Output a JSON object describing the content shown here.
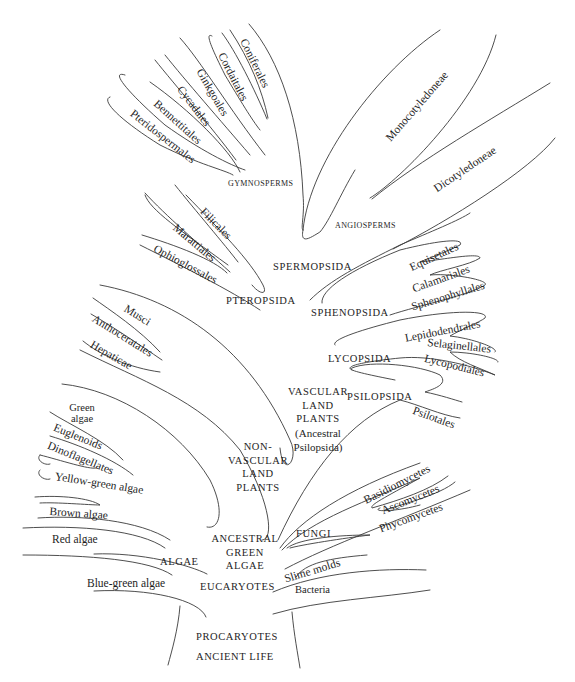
{
  "diagram": {
    "type": "phylogenetic-tree",
    "colors": {
      "background": "#ffffff",
      "line": "#3a3a3a",
      "text": "#1e1e1e"
    },
    "root": {
      "labels": [
        "PROCARYOTES",
        "ANCIENT LIFE"
      ]
    },
    "procaryotes": {
      "left_branch": "Blue-green algae",
      "right_branch": "Bacteria"
    },
    "eucaryotes": {
      "label": "EUCARYOTES",
      "slime_molds": "Slime molds"
    },
    "fungi": {
      "label": "FUNGI",
      "taxa": [
        "Basidiomycetes",
        "Ascomycetes",
        "Phycomycetes"
      ]
    },
    "algae": {
      "label": "ALGAE",
      "taxa": [
        "Green algae",
        "Euglenoids",
        "Dinoflagellates",
        "Yellow-green algae",
        "Brown algae",
        "Red algae"
      ],
      "green_algae_line1": "Green",
      "green_algae_line2": "algae"
    },
    "ancestral_green_algae": {
      "lines": [
        "ANCESTRAL",
        "GREEN",
        "ALGAE"
      ]
    },
    "non_vascular": {
      "lines": [
        "NON-",
        "VASCULAR",
        "LAND",
        "PLANTS"
      ],
      "taxa": [
        "Musci",
        "Anthoceratales",
        "Hepaticae"
      ]
    },
    "vascular": {
      "lines": [
        "VASCULAR",
        "LAND",
        "PLANTS",
        "(Ancestral",
        "Psilopsida)"
      ]
    },
    "psilopsida": {
      "label": "PSILOPSIDA",
      "taxa": [
        "Psilotales"
      ]
    },
    "lycopsida": {
      "label": "LYCOPSIDA",
      "taxa": [
        "Lepidodendrales",
        "Selaginellales",
        "Lycopodiales"
      ]
    },
    "sphenopsida": {
      "label": "SPHENOPSIDA",
      "taxa": [
        "Equisetales",
        "Calamariales",
        "Sphenophyllales"
      ]
    },
    "pteropsida": {
      "label": "PTEROPSIDA",
      "taxa": [
        "Filicales",
        "Marattiales",
        "Ophioglossales"
      ]
    },
    "spermopsida": {
      "label": "SPERMOPSIDA"
    },
    "gymnosperms": {
      "label": "GYMNOSPERMS",
      "taxa": [
        "Coniferales",
        "Cordaitales",
        "Ginkgoales",
        "Cycadales",
        "Bennettitales",
        "Pteridospermales"
      ]
    },
    "angiosperms": {
      "label": "ANGIOSPERMS",
      "taxa": [
        "Monocotyledoneae",
        "Dicotyledoneae"
      ]
    }
  }
}
